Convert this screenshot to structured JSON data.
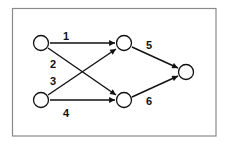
{
  "diagram": {
    "type": "directed-graph",
    "colors": {
      "frame": "#8a8a8a",
      "node_stroke": "#111111",
      "edge": "#111111",
      "label": "#111111",
      "background": "#ffffff"
    },
    "nodes": [
      {
        "id": "in-top",
        "x": 41,
        "y": 43
      },
      {
        "id": "in-bottom",
        "x": 41,
        "y": 100
      },
      {
        "id": "mid-top",
        "x": 124,
        "y": 43
      },
      {
        "id": "mid-bottom",
        "x": 124,
        "y": 100
      },
      {
        "id": "out",
        "x": 186,
        "y": 72
      }
    ],
    "edges": [
      {
        "label": "1",
        "from": "in-top",
        "to": "mid-top"
      },
      {
        "label": "2",
        "from": "in-top",
        "to": "mid-bottom"
      },
      {
        "label": "3",
        "from": "in-bottom",
        "to": "mid-top"
      },
      {
        "label": "4",
        "from": "in-bottom",
        "to": "mid-bottom"
      },
      {
        "label": "5",
        "from": "mid-top",
        "to": "out"
      },
      {
        "label": "6",
        "from": "mid-bottom",
        "to": "out"
      }
    ],
    "edge_labels": {
      "e1": "1",
      "e2": "2",
      "e3": "3",
      "e4": "4",
      "e5": "5",
      "e6": "6"
    }
  }
}
